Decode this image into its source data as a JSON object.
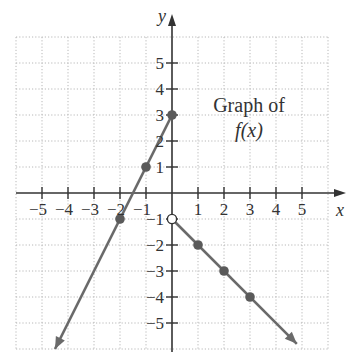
{
  "chart_data": {
    "type": "line",
    "title": "",
    "annotation": {
      "line1": "Graph of",
      "line2": "f(x)"
    },
    "xlabel": "x",
    "ylabel": "y",
    "xlim": [
      -6,
      6
    ],
    "ylim": [
      -6,
      6
    ],
    "grid": true,
    "x_ticks": [
      -5,
      -4,
      -3,
      -2,
      -1,
      1,
      2,
      3,
      4,
      5
    ],
    "y_ticks": [
      -5,
      -4,
      -3,
      -2,
      -1,
      1,
      2,
      3,
      4,
      5
    ],
    "x_tick_labels": [
      "−5",
      "−4",
      "−3",
      "−2",
      "−1",
      "1",
      "2",
      "3",
      "4",
      "5"
    ],
    "y_tick_labels": [
      "−5",
      "−4",
      "−3",
      "−2",
      "−1",
      "1",
      "2",
      "3",
      "4",
      "5"
    ],
    "series": [
      {
        "name": "left piece (x < 0)",
        "equation": "f(x) = 2x + 3",
        "points": [
          [
            -2,
            -1
          ],
          [
            -1,
            1
          ],
          [
            0,
            3
          ]
        ],
        "filled_points": [
          [
            -2,
            -1
          ],
          [
            -1,
            1
          ],
          [
            0,
            3
          ]
        ],
        "arrow_end": [
          -4.5,
          -6
        ]
      },
      {
        "name": "right piece (x > 0)",
        "equation": "f(x) = -x - 1",
        "points": [
          [
            0,
            -1
          ],
          [
            1,
            -2
          ],
          [
            2,
            -3
          ],
          [
            3,
            -4
          ]
        ],
        "open_points": [
          [
            0,
            -1
          ]
        ],
        "filled_points": [
          [
            1,
            -2
          ],
          [
            2,
            -3
          ],
          [
            3,
            -4
          ]
        ],
        "arrow_end": [
          4.8,
          -5.8
        ]
      }
    ]
  },
  "colors": {
    "axis": "#333333",
    "grid": "#b8b8b8",
    "curve": "#6a6a6a",
    "point": "#5a5a5a"
  }
}
